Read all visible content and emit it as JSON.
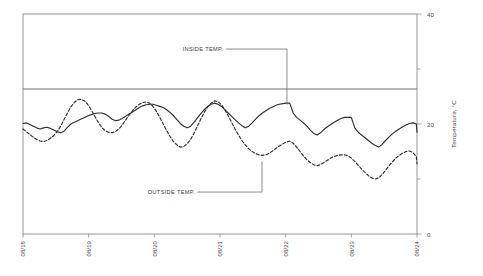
{
  "chart_data": {
    "type": "line",
    "title": "",
    "subtitle": "",
    "xlabel": "",
    "ylabel": "Temperature, °C",
    "xlim": [
      0,
      6
    ],
    "ylim": [
      0,
      40
    ],
    "grid": false,
    "legend_position": "inline-annotations",
    "y_ticks": [
      0,
      10,
      20,
      30,
      40
    ],
    "y_tick_labels": [
      "0",
      "",
      "20",
      "",
      "40"
    ],
    "y_major_labeled": [
      "40",
      "20",
      "0"
    ],
    "x_categories": [
      "08/18",
      "08/19",
      "08/20",
      "08/21",
      "08/22",
      "08/23",
      "08/24"
    ],
    "x_tick_values": [
      0,
      1,
      2,
      3,
      4,
      5,
      6
    ],
    "reference_line": {
      "name": "setpoint-line",
      "value": 26.4,
      "style": "solid",
      "color": "#6e6e6e",
      "spans": "full-width"
    },
    "annotations": [
      {
        "name": "inside-temp-annotation",
        "label": "INSIDE TEMP.",
        "text_x": 3.05,
        "text_y": 33.3,
        "leader_x": 4.02,
        "leader_y_top": 33.3,
        "leader_y_bottom": 23.5
      },
      {
        "name": "outside-temp-annotation",
        "label": "OUTSIDE TEMP.",
        "text_x": 2.62,
        "text_y": 7.3,
        "leader_x": 3.64,
        "leader_y_top": 13.2,
        "leader_y_bottom": 7.3
      }
    ],
    "series": [
      {
        "name": "INSIDE TEMP.",
        "style": "solid",
        "color": "#2f2f2f",
        "width": 1.15,
        "x": [
          0,
          0.052,
          0.104,
          0.156,
          0.208,
          0.26,
          0.312,
          0.365,
          0.417,
          0.469,
          0.521,
          0.573,
          0.625,
          0.677,
          0.729,
          0.781,
          0.833,
          0.885,
          0.938,
          0.99,
          1.042,
          1.094,
          1.146,
          1.198,
          1.25,
          1.302,
          1.354,
          1.406,
          1.458,
          1.51,
          1.562,
          1.615,
          1.667,
          1.719,
          1.771,
          1.823,
          1.875,
          1.927,
          1.979,
          2.031,
          2.083,
          2.135,
          2.188,
          2.24,
          2.292,
          2.344,
          2.396,
          2.448,
          2.5,
          2.552,
          2.604,
          2.656,
          2.708,
          2.76,
          2.812,
          2.865,
          2.917,
          2.969,
          3.021,
          3.073,
          3.125,
          3.177,
          3.229,
          3.281,
          3.333,
          3.385,
          3.438,
          3.49,
          3.542,
          3.594,
          3.646,
          3.698,
          3.75,
          3.802,
          3.854,
          3.906,
          3.958,
          4.01,
          4.062,
          4.115,
          4.167,
          4.219,
          4.271,
          4.323,
          4.375,
          4.427,
          4.479,
          4.531,
          4.583,
          4.635,
          4.688,
          4.74,
          4.792,
          4.844,
          4.896,
          4.948,
          5.0,
          5.052,
          5.104,
          5.156,
          5.208,
          5.26,
          5.312,
          5.365,
          5.417,
          5.469,
          5.521,
          5.573,
          5.625,
          5.677,
          5.729,
          5.781,
          5.833,
          5.885,
          5.938,
          5.99,
          6.0
        ],
        "y": [
          20.1,
          20.2,
          19.9,
          19.6,
          19.3,
          19.1,
          19.3,
          19.4,
          19.2,
          18.9,
          18.6,
          18.4,
          18.7,
          19.4,
          20.0,
          20.3,
          20.6,
          20.9,
          21.2,
          21.5,
          21.7,
          21.9,
          22.0,
          22.0,
          21.8,
          21.4,
          20.9,
          20.6,
          20.7,
          21.0,
          21.4,
          21.8,
          22.2,
          22.6,
          23.0,
          23.3,
          23.5,
          23.6,
          23.6,
          23.4,
          23.2,
          23.0,
          22.6,
          22.1,
          21.5,
          20.8,
          20.1,
          19.6,
          19.3,
          19.6,
          20.3,
          21.1,
          21.9,
          22.6,
          23.2,
          23.6,
          23.8,
          23.6,
          23.2,
          22.6,
          22.0,
          21.4,
          20.8,
          20.2,
          19.7,
          19.3,
          19.6,
          20.2,
          20.9,
          21.5,
          22.0,
          22.4,
          22.8,
          23.1,
          23.4,
          23.6,
          23.7,
          23.8,
          23.8,
          22.0,
          21.2,
          20.7,
          20.2,
          19.6,
          18.9,
          18.3,
          18.0,
          18.4,
          19.0,
          19.5,
          19.9,
          20.3,
          20.7,
          21.0,
          21.2,
          21.2,
          21.2,
          19.3,
          18.5,
          18.0,
          17.5,
          17.0,
          16.5,
          16.1,
          15.8,
          16.3,
          17.0,
          17.6,
          18.2,
          18.7,
          19.1,
          19.5,
          19.8,
          20.1,
          20.2,
          20.0,
          18.5
        ]
      },
      {
        "name": "OUTSIDE TEMP.",
        "style": "dashed",
        "color": "#2f2f2f",
        "width": 1.15,
        "dash": "3,2",
        "x": [
          0,
          0.052,
          0.104,
          0.156,
          0.208,
          0.26,
          0.312,
          0.365,
          0.417,
          0.469,
          0.521,
          0.573,
          0.625,
          0.677,
          0.729,
          0.781,
          0.833,
          0.885,
          0.938,
          0.99,
          1.042,
          1.094,
          1.146,
          1.198,
          1.25,
          1.302,
          1.354,
          1.406,
          1.458,
          1.51,
          1.562,
          1.615,
          1.667,
          1.719,
          1.771,
          1.823,
          1.875,
          1.927,
          1.979,
          2.031,
          2.083,
          2.135,
          2.188,
          2.24,
          2.292,
          2.344,
          2.396,
          2.448,
          2.5,
          2.552,
          2.604,
          2.656,
          2.708,
          2.76,
          2.812,
          2.865,
          2.917,
          2.969,
          3.021,
          3.073,
          3.125,
          3.177,
          3.229,
          3.281,
          3.333,
          3.385,
          3.438,
          3.49,
          3.542,
          3.594,
          3.646,
          3.698,
          3.75,
          3.802,
          3.854,
          3.906,
          3.958,
          4.01,
          4.062,
          4.115,
          4.167,
          4.219,
          4.271,
          4.323,
          4.375,
          4.427,
          4.479,
          4.531,
          4.583,
          4.635,
          4.688,
          4.74,
          4.792,
          4.844,
          4.896,
          4.948,
          5.0,
          5.052,
          5.104,
          5.156,
          5.208,
          5.26,
          5.312,
          5.365,
          5.417,
          5.469,
          5.521,
          5.573,
          5.625,
          5.677,
          5.729,
          5.781,
          5.833,
          5.885,
          5.938,
          5.99,
          6.0
        ],
        "y": [
          19.1,
          18.6,
          18.1,
          17.6,
          17.2,
          16.9,
          16.8,
          17.0,
          17.4,
          17.9,
          18.6,
          19.6,
          20.8,
          22.0,
          23.1,
          23.9,
          24.4,
          24.5,
          24.2,
          23.5,
          22.5,
          21.4,
          20.3,
          19.4,
          18.8,
          18.5,
          18.4,
          18.6,
          19.1,
          19.8,
          20.7,
          21.6,
          22.4,
          23.1,
          23.6,
          23.9,
          24.0,
          23.8,
          23.2,
          22.3,
          21.2,
          20.0,
          18.8,
          17.7,
          16.8,
          16.2,
          15.8,
          15.9,
          16.4,
          17.2,
          18.3,
          19.6,
          20.9,
          22.1,
          23.1,
          23.8,
          24.2,
          24.1,
          23.5,
          22.6,
          21.5,
          20.3,
          19.1,
          18.0,
          17.0,
          16.2,
          15.5,
          15.0,
          14.6,
          14.4,
          14.3,
          14.4,
          14.7,
          15.1,
          15.6,
          16.0,
          16.4,
          16.7,
          16.9,
          16.5,
          15.8,
          15.0,
          14.2,
          13.5,
          13.0,
          12.6,
          12.4,
          12.6,
          13.0,
          13.4,
          13.8,
          14.1,
          14.3,
          14.4,
          14.4,
          14.2,
          13.8,
          13.2,
          12.5,
          11.8,
          11.2,
          10.6,
          10.2,
          10.0,
          10.2,
          10.8,
          11.6,
          12.4,
          13.1,
          13.8,
          14.3,
          14.7,
          15.0,
          15.1,
          14.8,
          14.1,
          12.8
        ]
      }
    ]
  },
  "axes": {
    "y_label_40": "40",
    "y_label_20": "20",
    "y_label_0": "0",
    "y_title": "Temperature, °C",
    "x_labels": [
      "08/18",
      "08/19",
      "08/20",
      "08/21",
      "08/22",
      "08/23",
      "08/24"
    ]
  },
  "colors": {
    "frame": "#8c8c8c",
    "series": "#2f2f2f",
    "reference_line": "#6e6e6e",
    "text": "#4a4a4a",
    "background": "#ffffff"
  }
}
